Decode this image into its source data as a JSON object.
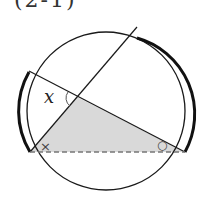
{
  "header": {
    "label": "(2-1)"
  },
  "diagram": {
    "angle_label": "x",
    "mark_left": "×",
    "mark_right": "○",
    "colors": {
      "stroke": "#1a1a1a",
      "shade": "#d9d9d9",
      "dash": "#777777"
    }
  }
}
